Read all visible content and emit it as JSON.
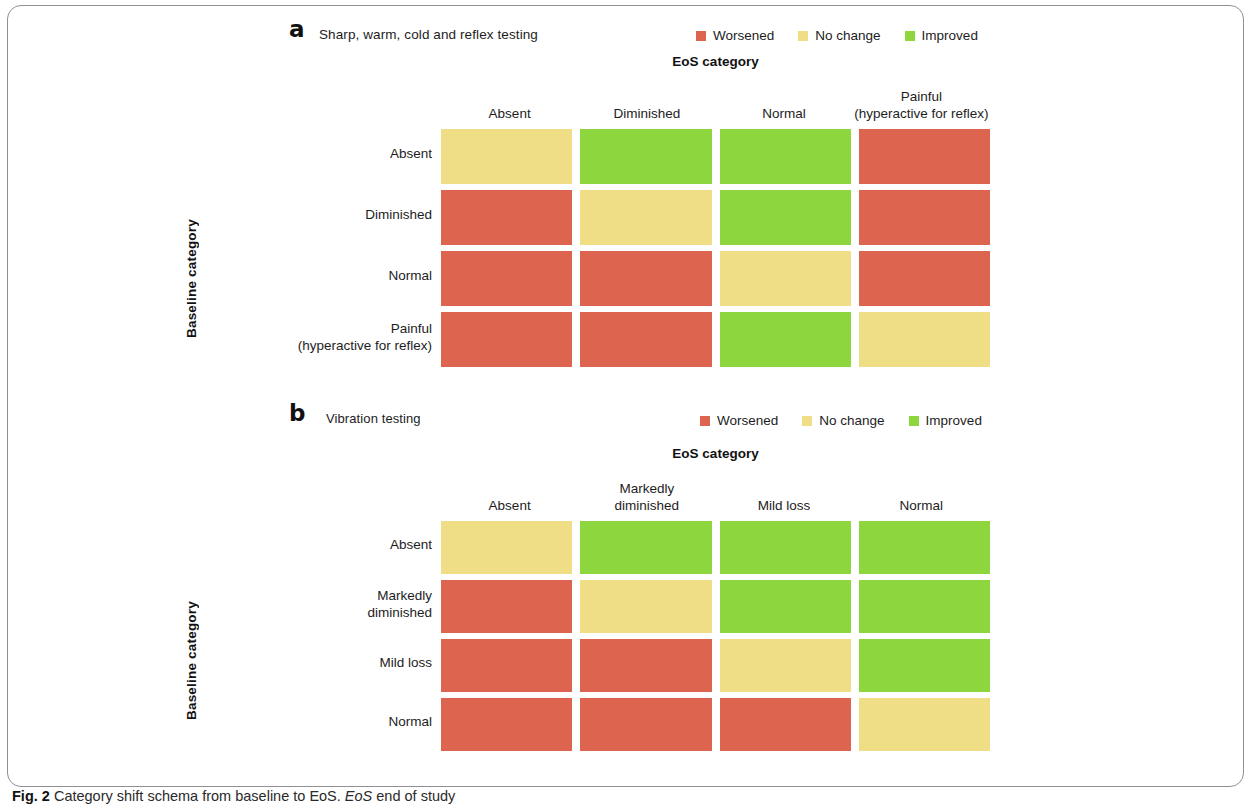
{
  "figure": {
    "caption_label": "Fig. 2",
    "caption_text": " Category shift schema from baseline to EoS. ",
    "caption_italic": "EoS",
    "caption_tail": " end of study"
  },
  "legend": {
    "items": [
      {
        "label": "Worsened",
        "color": "#dd6550",
        "key": "worsened"
      },
      {
        "label": "No change",
        "color": "#f0de86",
        "key": "nochange"
      },
      {
        "label": "Improved",
        "color": "#8ed63e",
        "key": "improved"
      }
    ]
  },
  "axis": {
    "x_title": "EoS category",
    "y_title": "Baseline category"
  },
  "panel_a": {
    "letter": "a",
    "title": "Sharp, warm, cold and reflex testing"
  },
  "panel_b": {
    "letter": "b",
    "title": "Vibration testing"
  },
  "chart_data": [
    {
      "type": "heatmap",
      "title": "Sharp, warm, cold and reflex testing",
      "panel": "a",
      "xlabel": "EoS category",
      "ylabel": "Baseline category",
      "categories_x": [
        "Absent",
        "Diminished",
        "Normal",
        "Painful (hyperactive for reflex)"
      ],
      "categories_x_lines": [
        [
          "Absent",
          ""
        ],
        [
          "Diminished",
          ""
        ],
        [
          "Normal",
          ""
        ],
        [
          "Painful",
          "(hyperactive for reflex)"
        ]
      ],
      "categories_y": [
        "Absent",
        "Diminished",
        "Normal",
        "Painful (hyperactive for reflex)"
      ],
      "categories_y_lines": [
        [
          "Absent",
          ""
        ],
        [
          "Diminished",
          ""
        ],
        [
          "Normal",
          ""
        ],
        [
          "Painful",
          "(hyperactive for reflex)"
        ]
      ],
      "legend_position": "top-right",
      "grid": false,
      "values": [
        [
          "nochange",
          "improved",
          "improved",
          "worsened"
        ],
        [
          "worsened",
          "nochange",
          "improved",
          "worsened"
        ],
        [
          "worsened",
          "worsened",
          "nochange",
          "worsened"
        ],
        [
          "worsened",
          "worsened",
          "improved",
          "nochange"
        ]
      ]
    },
    {
      "type": "heatmap",
      "title": "Vibration testing",
      "panel": "b",
      "xlabel": "EoS category",
      "ylabel": "Baseline category",
      "categories_x": [
        "Absent",
        "Markedly diminished",
        "Mild loss",
        "Normal"
      ],
      "categories_x_lines": [
        [
          "Absent",
          ""
        ],
        [
          "Markedly",
          "diminished"
        ],
        [
          "Mild loss",
          ""
        ],
        [
          "Normal",
          ""
        ]
      ],
      "categories_y": [
        "Absent",
        "Markedly diminished",
        "Mild loss",
        "Normal"
      ],
      "categories_y_lines": [
        [
          "Absent",
          ""
        ],
        [
          "Markedly",
          "diminished"
        ],
        [
          "Mild loss",
          ""
        ],
        [
          "Normal",
          ""
        ]
      ],
      "legend_position": "top-right",
      "grid": false,
      "values": [
        [
          "nochange",
          "improved",
          "improved",
          "improved"
        ],
        [
          "worsened",
          "nochange",
          "improved",
          "improved"
        ],
        [
          "worsened",
          "worsened",
          "nochange",
          "improved"
        ],
        [
          "worsened",
          "worsened",
          "worsened",
          "nochange"
        ]
      ]
    }
  ]
}
